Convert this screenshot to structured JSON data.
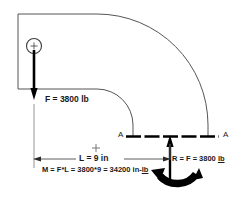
{
  "diagram": {
    "colors": {
      "pipe_outline": "#55555a",
      "load_arrow": "#000000",
      "section_line": "#000000",
      "dimension_line": "#4a4a4a",
      "text": "#1a1a1a",
      "background": "#ffffff"
    },
    "labels": {
      "applied_force": "F = 3800 lb",
      "length": "L = 9 in",
      "moment_prefix": "M = F*L = 3800*9 = 34200 in-",
      "moment_unit": "lb",
      "reaction_prefix": "R = F = 3800 ",
      "reaction_unit": "lb",
      "section_left": "A",
      "section_right": "A"
    },
    "icons": {
      "center_mark_circle": "circled-crosshair-icon",
      "center_mark_small": "crosshair-icon",
      "force_arrow": "down-arrow-icon",
      "reaction_arrow": "up-arrow-icon",
      "moment_arrow": "curved-moment-arrow-icon",
      "dimension_arrow_left": "left-arrow-icon",
      "dimension_arrow_right": "right-arrow-icon"
    },
    "values": {
      "force_magnitude": 3800,
      "force_unit": "lb",
      "length_magnitude": 9,
      "length_unit": "in",
      "moment_magnitude": 34200,
      "moment_unit": "in-lb",
      "reaction_magnitude": 3800,
      "reaction_unit": "lb"
    }
  }
}
